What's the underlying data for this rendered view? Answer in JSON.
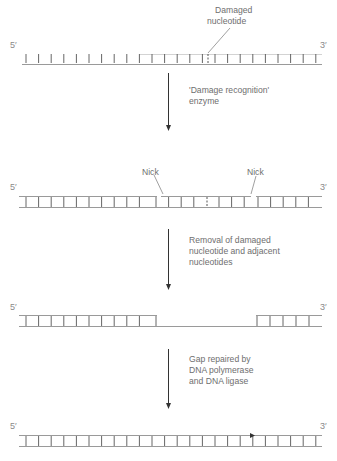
{
  "labels": {
    "damaged_1": "Damaged",
    "damaged_2": "nucleotide",
    "step1_1": "'Damage recognition'",
    "step1_2": "enzyme",
    "nick_left": "Nick",
    "nick_right": "Nick",
    "step2_1": "Removal of damaged",
    "step2_2": "nucleotide and adjacent",
    "step2_3": "nucleotides",
    "step3_1": "Gap repaired by",
    "step3_2": "DNA polymerase",
    "step3_3": "and DNA ligase"
  },
  "ends": {
    "five_prime": "5′",
    "three_prime": "3′"
  },
  "colors": {
    "strand": "#9a9a9a",
    "rung": "#555555",
    "arrow": "#333333",
    "text": "#6e6e6e"
  }
}
